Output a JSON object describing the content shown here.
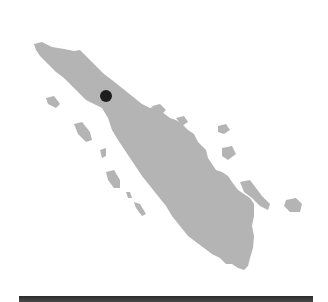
{
  "map": {
    "region": "Sumatra",
    "land_color": "#b4b4b4",
    "marker": {
      "type": "location-dot",
      "color": "#1e1e1e",
      "x": 106,
      "y": 96,
      "radius": 6
    }
  },
  "footer_bar": {
    "color": "#333333"
  }
}
